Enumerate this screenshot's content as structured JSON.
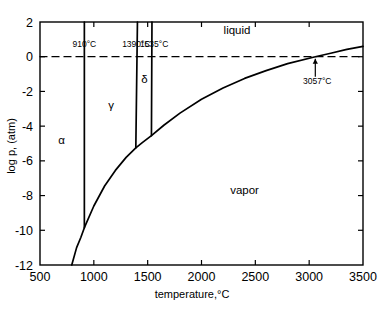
{
  "figure": {
    "kind": "phase-diagram",
    "substance": "iron"
  },
  "chart_data": {
    "type": "line",
    "title": "",
    "xlabel": "temperature,°C",
    "ylabel": "log p, (atm)",
    "xlim": [
      500,
      3500
    ],
    "ylim": [
      -12,
      2
    ],
    "xticks": [
      500,
      1000,
      1500,
      2000,
      2500,
      3000,
      3500
    ],
    "yticks": [
      2,
      0,
      -2,
      -4,
      -6,
      -8,
      -10,
      -12
    ],
    "xtick_labels": [
      "500",
      "1000",
      "1500",
      "2000",
      "2500",
      "3000",
      "3500"
    ],
    "ytick_labels": [
      "2",
      "0",
      "-2",
      "-4",
      "-6",
      "-8",
      "-10",
      "-12"
    ],
    "grid": false,
    "legend": "none",
    "series": [
      {
        "name": "sublimation-vaporization curve",
        "style": "solid",
        "points": [
          [
            795,
            -12.0
          ],
          [
            840,
            -11.0
          ],
          [
            880,
            -10.4
          ],
          [
            912,
            -9.85
          ],
          [
            1000,
            -8.6
          ],
          [
            1100,
            -7.45
          ],
          [
            1200,
            -6.55
          ],
          [
            1300,
            -5.8
          ],
          [
            1390,
            -5.25
          ],
          [
            1450,
            -4.95
          ],
          [
            1535,
            -4.55
          ],
          [
            1650,
            -3.95
          ],
          [
            1800,
            -3.25
          ],
          [
            2000,
            -2.45
          ],
          [
            2200,
            -1.8
          ],
          [
            2400,
            -1.25
          ],
          [
            2600,
            -0.8
          ],
          [
            2800,
            -0.4
          ],
          [
            3057,
            0.0
          ],
          [
            3200,
            0.2
          ],
          [
            3350,
            0.42
          ],
          [
            3500,
            0.6
          ]
        ]
      },
      {
        "name": "alpha-gamma boundary (910°C)",
        "style": "solid",
        "points": [
          [
            912,
            2.0
          ],
          [
            912,
            -9.85
          ]
        ]
      },
      {
        "name": "gamma-delta boundary (1390°C)",
        "style": "solid",
        "points": [
          [
            1405,
            2.0
          ],
          [
            1390,
            -5.25
          ]
        ]
      },
      {
        "name": "delta-liquid boundary (1535°C)",
        "style": "solid",
        "points": [
          [
            1540,
            2.0
          ],
          [
            1535,
            -4.55
          ]
        ]
      },
      {
        "name": "one atmosphere reference line",
        "style": "dashed",
        "points": [
          [
            500,
            0.0
          ],
          [
            3500,
            0.0
          ]
        ]
      }
    ],
    "annotations": [
      {
        "name": "alpha-region-label",
        "text": "α",
        "x": 700,
        "y": -5.0
      },
      {
        "name": "gamma-region-label",
        "text": "γ",
        "x": 1160,
        "y": -3.0
      },
      {
        "name": "delta-region-label",
        "text": "δ",
        "x": 1470,
        "y": -1.5
      },
      {
        "name": "liquid-region-label",
        "text": "liquid",
        "x": 2330,
        "y": 1.3
      },
      {
        "name": "vapor-region-label",
        "text": "vapor",
        "x": 2400,
        "y": -7.9
      },
      {
        "name": "alpha-gamma-temperature-label",
        "text": "910°C",
        "x": 912,
        "y": 0.55
      },
      {
        "name": "gamma-delta-temperature-label",
        "text": "1390°C",
        "x": 1395,
        "y": 0.55
      },
      {
        "name": "delta-liquid-temperature-label",
        "text": "1535°C",
        "x": 1560,
        "y": 0.55
      },
      {
        "name": "critical-boiling-point-label",
        "text": "3057°C",
        "x": 3075,
        "y": -1.6
      }
    ]
  }
}
